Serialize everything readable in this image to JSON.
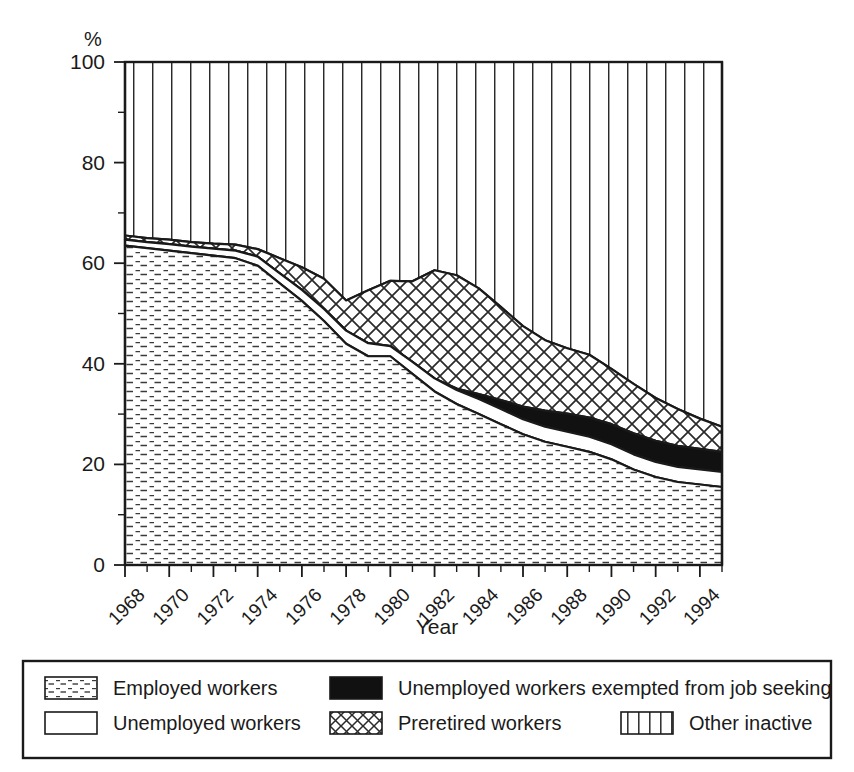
{
  "figure": {
    "unit_label": "%",
    "xlabel": "Year",
    "ylabel": ""
  },
  "legend": {
    "items": [
      {
        "key": "employed",
        "label": "Employed workers",
        "pattern": "horizontal-dashes"
      },
      {
        "key": "unemployed",
        "label": "Unemployed workers",
        "pattern": "solid-white"
      },
      {
        "key": "exempted",
        "label": "Unemployed workers exempted from job seeking",
        "pattern": "solid-black"
      },
      {
        "key": "preretired",
        "label": "Preretired workers",
        "pattern": "crosshatch"
      },
      {
        "key": "other_inactive",
        "label": "Other inactive",
        "pattern": "vertical-lines"
      }
    ]
  },
  "chart_data": {
    "type": "area",
    "stacked": true,
    "title": "",
    "xlabel": "Year",
    "ylabel": "%",
    "unit": "%",
    "grid": false,
    "legend_position": "bottom",
    "xlim": [
      1968,
      1995
    ],
    "ylim": [
      0,
      100
    ],
    "yticks": [
      0,
      20,
      40,
      60,
      80,
      100
    ],
    "yticks_minor": [
      10,
      30,
      50,
      70,
      90
    ],
    "xticks": [
      1968,
      1970,
      1972,
      1974,
      1976,
      1978,
      1980,
      1982,
      1984,
      1986,
      1988,
      1990,
      1992,
      1994
    ],
    "xtick_labels": [
      "1968",
      "1970",
      "1972",
      "1974",
      "1976",
      "1978",
      "1980",
      "1982",
      "1984",
      "1986",
      "1988",
      "1990",
      "1992",
      "1994"
    ],
    "x": [
      1968,
      1969,
      1970,
      1971,
      1972,
      1973,
      1974,
      1975,
      1976,
      1977,
      1978,
      1979,
      1980,
      1981,
      1982,
      1983,
      1984,
      1985,
      1986,
      1987,
      1988,
      1989,
      1990,
      1991,
      1992,
      1993,
      1994,
      1995
    ],
    "series": [
      {
        "name": "Employed workers",
        "key": "employed",
        "pattern": "horizontal-dashes",
        "values": [
          63.5,
          63.0,
          62.5,
          62.0,
          61.5,
          61.0,
          59.5,
          56.0,
          52.5,
          48.5,
          44.0,
          41.5,
          41.5,
          38.0,
          34.5,
          32.0,
          30.0,
          28.0,
          26.0,
          24.5,
          23.5,
          22.5,
          21.0,
          19.0,
          17.5,
          16.5,
          16.0,
          15.5
        ]
      },
      {
        "name": "Unemployed workers",
        "key": "unemployed",
        "pattern": "solid-white",
        "values": [
          1.2,
          1.2,
          1.3,
          1.3,
          1.4,
          1.5,
          1.8,
          2.0,
          2.2,
          2.4,
          2.6,
          2.6,
          2.0,
          2.4,
          2.6,
          2.8,
          3.0,
          3.0,
          3.0,
          3.0,
          3.0,
          3.0,
          3.0,
          3.0,
          3.0,
          3.0,
          3.0,
          3.0
        ]
      },
      {
        "name": "Unemployed workers exempted from job seeking",
        "key": "exempted",
        "pattern": "solid-black",
        "values": [
          0.0,
          0.0,
          0.0,
          0.0,
          0.0,
          0.0,
          0.0,
          0.0,
          0.0,
          0.0,
          0.0,
          0.0,
          0.0,
          0.0,
          0.0,
          0.3,
          1.0,
          1.8,
          2.5,
          3.2,
          3.6,
          3.8,
          4.0,
          4.2,
          4.2,
          4.2,
          4.1,
          4.0
        ]
      },
      {
        "name": "Preretired workers",
        "key": "preretired",
        "pattern": "crosshatch",
        "values": [
          0.8,
          0.8,
          0.9,
          0.9,
          1.0,
          1.2,
          1.5,
          3.0,
          4.5,
          6.0,
          6.0,
          10.5,
          13.0,
          16.0,
          21.5,
          22.5,
          21.0,
          18.5,
          16.0,
          14.0,
          13.0,
          12.5,
          11.0,
          9.8,
          8.5,
          7.3,
          6.0,
          5.0
        ]
      },
      {
        "name": "Other inactive",
        "key": "other_inactive",
        "pattern": "vertical-lines",
        "values": [
          34.5,
          35.0,
          35.3,
          35.8,
          36.1,
          36.3,
          37.2,
          39.0,
          40.8,
          43.1,
          47.4,
          45.4,
          43.5,
          43.6,
          41.4,
          42.4,
          45.0,
          48.7,
          52.5,
          55.3,
          56.9,
          58.2,
          61.0,
          64.0,
          66.8,
          69.0,
          70.9,
          72.5
        ]
      }
    ],
    "cumulative_tops": {
      "employed": [
        63.5,
        63.0,
        62.5,
        62.0,
        61.5,
        61.0,
        59.5,
        56.0,
        52.5,
        48.5,
        44.0,
        41.5,
        41.5,
        38.0,
        34.5,
        32.0,
        30.0,
        28.0,
        26.0,
        24.5,
        23.5,
        22.5,
        21.0,
        19.0,
        17.5,
        16.5,
        16.0,
        15.5
      ],
      "unemployed": [
        64.7,
        64.2,
        63.8,
        63.3,
        62.9,
        62.5,
        61.3,
        58.0,
        54.7,
        50.9,
        46.6,
        44.1,
        43.5,
        40.4,
        37.1,
        34.8,
        33.0,
        31.0,
        29.0,
        27.5,
        26.5,
        25.5,
        24.0,
        22.0,
        20.5,
        19.5,
        19.0,
        18.5
      ],
      "exempted": [
        64.7,
        64.2,
        63.8,
        63.3,
        62.9,
        62.5,
        61.3,
        58.0,
        54.7,
        50.9,
        46.6,
        44.1,
        43.5,
        40.4,
        37.1,
        35.1,
        34.0,
        32.8,
        31.5,
        30.7,
        30.1,
        29.3,
        28.0,
        26.2,
        24.7,
        23.7,
        23.1,
        22.5
      ],
      "preretired": [
        65.5,
        65.0,
        64.7,
        64.2,
        63.9,
        63.7,
        62.8,
        61.0,
        59.2,
        56.9,
        52.6,
        54.6,
        56.5,
        56.4,
        58.6,
        57.6,
        55.0,
        51.3,
        47.5,
        44.7,
        43.1,
        41.8,
        39.0,
        36.0,
        33.2,
        31.0,
        29.1,
        27.5
      ],
      "other": [
        100,
        100,
        100,
        100,
        100,
        100,
        100,
        100,
        100,
        100,
        100,
        100,
        100,
        100,
        100,
        100,
        100,
        100,
        100,
        100,
        100,
        100,
        100,
        100,
        100,
        100,
        100,
        100
      ]
    }
  }
}
